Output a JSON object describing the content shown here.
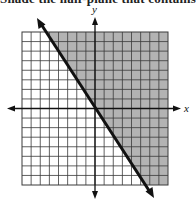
{
  "header": {
    "instruction_text": "Shade the half-plane that contains"
  },
  "graph": {
    "x_axis_label": "x",
    "y_axis_label": "y",
    "grid": {
      "columns": 16,
      "rows": 16,
      "x_range": [
        -8,
        8
      ],
      "y_range": [
        -8,
        8
      ]
    },
    "boundary_line": {
      "equation": "y = -3/2 x",
      "slope": -1.5,
      "intercept": 0,
      "style": "solid",
      "arrows": "both ends"
    },
    "shaded_region": "right/above the line (y > -3/2 x)",
    "colors": {
      "shade": "#b3b3b3",
      "grid_line": "#3a3a3a",
      "line": "#111111"
    }
  }
}
